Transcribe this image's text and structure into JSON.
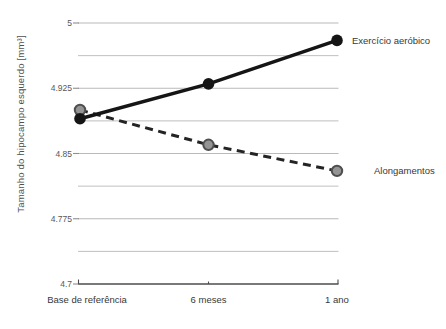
{
  "chart_data": {
    "type": "line",
    "title": "",
    "xlabel": "",
    "ylabel": "Tamanho do hipocampo esquerdo [mm³]",
    "categories": [
      "Base de referência",
      "6 meses",
      "1 ano"
    ],
    "series": [
      {
        "name": "Exercício aeróbico",
        "values": [
          4.89,
          4.93,
          4.98
        ],
        "line_style": "solid",
        "line_color": "#151515",
        "marker": "circle",
        "marker_fill": "#151515",
        "marker_stroke": "#151515",
        "label_position": "right-of-last-point"
      },
      {
        "name": "Alongamentos",
        "values": [
          4.9,
          4.86,
          4.83
        ],
        "line_style": "dashed",
        "line_color": "#242424",
        "marker": "circle",
        "marker_fill": "#949494",
        "marker_stroke": "#4f4f4f",
        "label_position": "right-of-last-point"
      }
    ],
    "ylim": [
      4.7,
      5.0
    ],
    "yticks": [
      5,
      4.925,
      4.85,
      4.775,
      4.7
    ],
    "ytick_labels": [
      "5",
      "4.925",
      "4.85",
      "4.775",
      "4.7"
    ],
    "minor_gridlines": true,
    "grid_on": true,
    "legend_position": "end-of-line",
    "background": "#ffffff",
    "grid_color": "#b9b9b9",
    "axis_color": "#4d4d4d",
    "tick_label_color": "#585858",
    "text_color": "#383838",
    "ylabel_color": "#4f4f4f"
  }
}
